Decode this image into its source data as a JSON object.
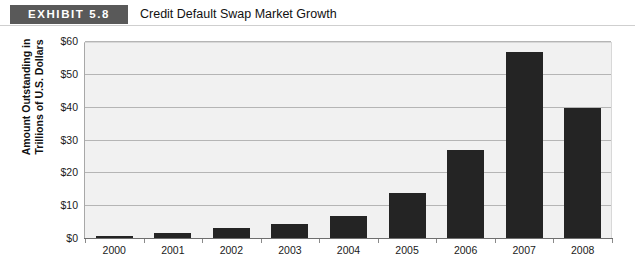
{
  "header": {
    "badge_label": "EXHIBIT 5.8",
    "title": "Credit Default Swap Market Growth"
  },
  "chart_data": {
    "type": "bar",
    "title": "Credit Default Swap Market Growth",
    "xlabel": "",
    "ylabel": "Amount Outstanding in Trillions of U.S. Dollars",
    "ylabel_line1": "Amount Outstanding in",
    "ylabel_line2": "Trillions of U.S. Dollars",
    "categories": [
      "2000",
      "2001",
      "2002",
      "2003",
      "2004",
      "2005",
      "2006",
      "2007",
      "2008"
    ],
    "values": [
      0.9,
      1.9,
      3.5,
      4.7,
      7.0,
      14.0,
      27.0,
      57.0,
      40.0
    ],
    "ylim": [
      0,
      60
    ],
    "yticks": [
      0,
      10,
      20,
      30,
      40,
      50,
      60
    ],
    "ytick_labels": [
      "$0",
      "$10",
      "$20",
      "$30",
      "$40",
      "$50",
      "$60"
    ],
    "grid": true,
    "legend": false,
    "bar_color": "#242424",
    "plot_background": "#f1f1f1",
    "gridline_color": "#b5b5b5"
  },
  "colors": {
    "badge_background": "#595959",
    "badge_text": "#ffffff",
    "bar": "#242424",
    "plot_background": "#f1f1f1"
  }
}
